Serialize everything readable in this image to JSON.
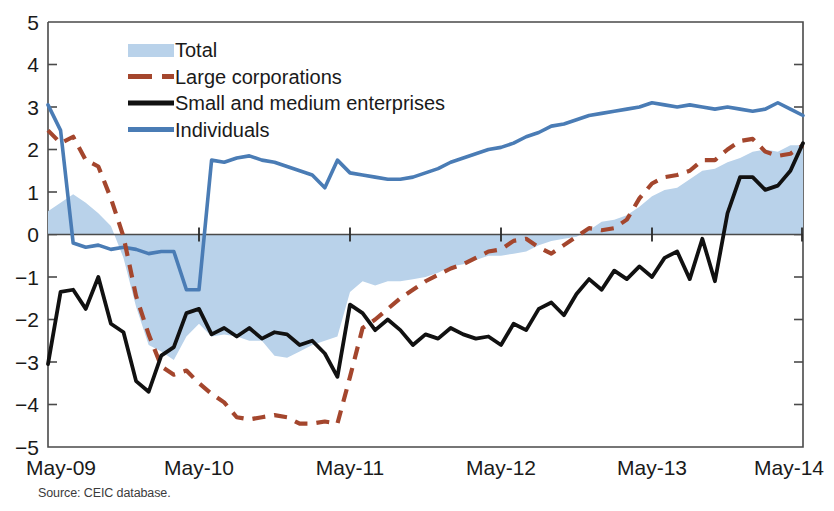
{
  "figure": {
    "title_partial": "",
    "source_note": "Source: CEIC database."
  },
  "axes": {
    "y_ticks": [
      "5",
      "4",
      "3",
      "2",
      "1",
      "0",
      "−1",
      "−2",
      "−3",
      "−4",
      "−5"
    ],
    "x_ticks": [
      "May-09",
      "May-10",
      "May-11",
      "May-12",
      "May-13",
      "May-14"
    ],
    "ylim": [
      -5,
      5
    ],
    "ylabel": "",
    "xlabel": ""
  },
  "legend": {
    "position": "top-left-inside",
    "items": [
      {
        "label": "Total",
        "marker": "area-swatch",
        "color": "#b9d2ea"
      },
      {
        "label": "Large corporations",
        "marker": "dashed-line",
        "color": "#a4462d"
      },
      {
        "label": "Small and medium enterprises",
        "marker": "solid-line",
        "color": "#111111"
      },
      {
        "label": "Individuals",
        "marker": "solid-line",
        "color": "#4a7cb5"
      }
    ]
  },
  "chart_data": {
    "type": "line",
    "title": "",
    "xlabel": "",
    "ylabel": "",
    "ylim": [
      -5,
      5
    ],
    "grid": false,
    "legend_position": "upper left",
    "x_tick_labels": [
      "May-09",
      "May-10",
      "May-11",
      "May-12",
      "May-13",
      "May-14"
    ],
    "x_tick_values": [
      0,
      12,
      24,
      36,
      48,
      60
    ],
    "x_unit": "months since May-09",
    "series": [
      {
        "name": "Total",
        "type": "area",
        "color": "#b9d2ea",
        "values": [
          0.55,
          0.75,
          0.95,
          0.75,
          0.5,
          0.2,
          -0.55,
          -1.7,
          -2.6,
          -2.75,
          -2.95,
          -2.4,
          -2.1,
          -2.4,
          -2.35,
          -2.4,
          -2.5,
          -2.5,
          -2.85,
          -2.9,
          -2.75,
          -2.6,
          -2.5,
          -2.4,
          -1.35,
          -1.1,
          -1.2,
          -1.1,
          -1.1,
          -1.05,
          -1.0,
          -0.9,
          -0.75,
          -0.7,
          -0.6,
          -0.5,
          -0.5,
          -0.45,
          -0.4,
          -0.25,
          -0.15,
          -0.1,
          -0.05,
          0.1,
          0.3,
          0.35,
          0.45,
          0.65,
          0.9,
          1.05,
          1.1,
          1.3,
          1.5,
          1.55,
          1.7,
          1.8,
          1.95,
          2.0,
          1.95,
          2.1,
          2.1
        ]
      },
      {
        "name": "Large corporations",
        "type": "line-dashed",
        "color": "#a4462d",
        "values": [
          2.45,
          2.15,
          2.3,
          1.75,
          1.6,
          0.85,
          -0.05,
          -1.45,
          -2.35,
          -3.1,
          -3.3,
          -3.2,
          -3.5,
          -3.75,
          -3.95,
          -4.3,
          -4.35,
          -4.3,
          -4.25,
          -4.3,
          -4.45,
          -4.45,
          -4.4,
          -4.45,
          -3.35,
          -2.2,
          -2.0,
          -1.75,
          -1.5,
          -1.3,
          -1.1,
          -0.95,
          -0.8,
          -0.7,
          -0.55,
          -0.4,
          -0.35,
          -0.15,
          -0.1,
          -0.3,
          -0.45,
          -0.25,
          -0.05,
          0.15,
          0.1,
          0.15,
          0.35,
          0.85,
          1.2,
          1.35,
          1.4,
          1.5,
          1.75,
          1.75,
          2.0,
          2.2,
          2.25,
          1.95,
          1.85,
          1.9,
          2.1
        ]
      },
      {
        "name": "Small and medium enterprises",
        "type": "line-solid",
        "color": "#111111",
        "values": [
          -3.05,
          -1.35,
          -1.3,
          -1.75,
          -1.0,
          -2.1,
          -2.3,
          -3.45,
          -3.7,
          -2.85,
          -2.65,
          -1.85,
          -1.75,
          -2.35,
          -2.2,
          -2.4,
          -2.2,
          -2.45,
          -2.3,
          -2.35,
          -2.6,
          -2.5,
          -2.8,
          -3.35,
          -1.65,
          -1.85,
          -2.25,
          -2.0,
          -2.25,
          -2.6,
          -2.35,
          -2.45,
          -2.2,
          -2.35,
          -2.45,
          -2.4,
          -2.6,
          -2.1,
          -2.25,
          -1.75,
          -1.6,
          -1.9,
          -1.4,
          -1.05,
          -1.3,
          -0.85,
          -1.05,
          -0.75,
          -1.0,
          -0.55,
          -0.4,
          -1.05,
          -0.1,
          -1.1,
          0.5,
          1.35,
          1.35,
          1.05,
          1.15,
          1.5,
          2.15
        ]
      },
      {
        "name": "Individuals",
        "type": "line-solid",
        "color": "#4a7cb5",
        "values": [
          3.05,
          2.45,
          -0.2,
          -0.3,
          -0.25,
          -0.35,
          -0.3,
          -0.35,
          -0.45,
          -0.4,
          -0.4,
          -1.3,
          -1.3,
          1.75,
          1.7,
          1.8,
          1.85,
          1.75,
          1.7,
          1.6,
          1.5,
          1.4,
          1.1,
          1.75,
          1.45,
          1.4,
          1.35,
          1.3,
          1.3,
          1.35,
          1.45,
          1.55,
          1.7,
          1.8,
          1.9,
          2.0,
          2.05,
          2.15,
          2.3,
          2.4,
          2.55,
          2.6,
          2.7,
          2.8,
          2.85,
          2.9,
          2.95,
          3.0,
          3.1,
          3.05,
          3.0,
          3.05,
          3.0,
          2.95,
          3.0,
          2.95,
          2.9,
          2.95,
          3.1,
          2.95,
          2.8
        ]
      }
    ]
  }
}
